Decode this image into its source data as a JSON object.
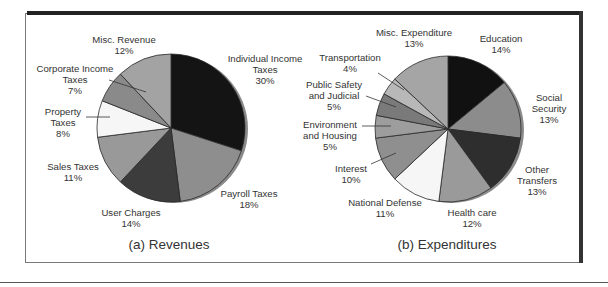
{
  "chart_data": [
    {
      "type": "pie",
      "title": "(a) Revenues",
      "categories": [
        "Individual Income Taxes",
        "Payroll Taxes",
        "User Charges",
        "Sales Taxes",
        "Property Taxes",
        "Corporate Income Taxes",
        "Misc. Revenue"
      ],
      "values": [
        30,
        18,
        14,
        11,
        8,
        7,
        12
      ],
      "unit": "%",
      "colors": [
        "#141414",
        "#8e8e8e",
        "#3c3c3c",
        "#999999",
        "#f6f6f6",
        "#8a8a8a",
        "#a3a3a3"
      ],
      "labels": {
        "individual": {
          "line1": "Individual Income",
          "line2": "Taxes",
          "pct": "30%"
        },
        "payroll": {
          "line1": "Payroll Taxes",
          "pct": "18%"
        },
        "user_charges": {
          "line1": "User Charges",
          "pct": "14%"
        },
        "sales": {
          "line1": "Sales Taxes",
          "pct": "11%"
        },
        "property": {
          "line1": "Property",
          "line2": "Taxes",
          "pct": "8%"
        },
        "corporate": {
          "line1": "Corporate Income",
          "line2": "Taxes",
          "pct": "7%"
        },
        "misc": {
          "line1": "Misc. Revenue",
          "pct": "12%"
        }
      }
    },
    {
      "type": "pie",
      "title": "(b) Expenditures",
      "categories": [
        "Education",
        "Social Security",
        "Other Transfers",
        "Health care",
        "National Defense",
        "Interest",
        "Environment and Housing",
        "Public Safety and Judicial",
        "Transportation",
        "Misc. Expenditure"
      ],
      "values": [
        14,
        13,
        13,
        12,
        11,
        10,
        5,
        5,
        4,
        13
      ],
      "unit": "%",
      "colors": [
        "#111111",
        "#8c8c8c",
        "#2e2e2e",
        "#9a9a9a",
        "#f6f6f6",
        "#8f8f8f",
        "#9d9d9d",
        "#7a7a7a",
        "#b8b8b8",
        "#a5a5a5"
      ],
      "labels": {
        "education": {
          "line1": "Education",
          "pct": "14%"
        },
        "social_security": {
          "line1": "Social",
          "line2": "Security",
          "pct": "13%"
        },
        "other_transfers": {
          "line1": "Other",
          "line2": "Transfers",
          "pct": "13%"
        },
        "health": {
          "line1": "Health care",
          "pct": "12%"
        },
        "defense": {
          "line1": "National Defense",
          "pct": "11%"
        },
        "interest": {
          "line1": "Interest",
          "pct": "10%"
        },
        "environment": {
          "line1": "Environment",
          "line2": "and Housing",
          "pct": "5%"
        },
        "public_safety": {
          "line1": "Public Safety",
          "line2": "and Judicial",
          "pct": "5%"
        },
        "transportation": {
          "line1": "Transportation",
          "pct": "4%"
        },
        "misc": {
          "line1": "Misc. Expenditure",
          "pct": "13%"
        }
      }
    }
  ]
}
